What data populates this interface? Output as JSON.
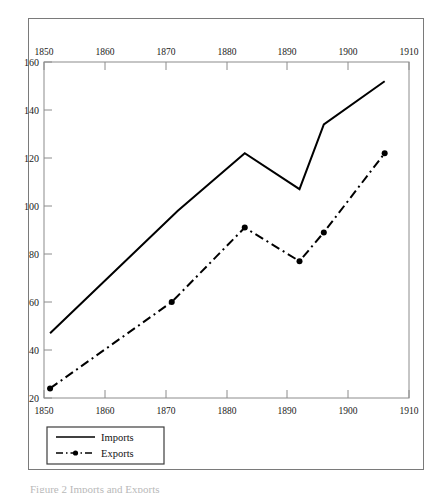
{
  "figure": {
    "caption": "Figure 2 Imports and Exports",
    "background_color": "#ffffff",
    "frame_color": "#7a7a7a",
    "line_color": "#000000"
  },
  "chart_data": {
    "type": "line",
    "title": "",
    "xlabel": "",
    "ylabel": "",
    "xlim": [
      1850,
      1910
    ],
    "ylim": [
      20,
      160
    ],
    "grid": false,
    "legend_position": "bottom-left",
    "x_ticks_top": [
      "1850",
      "1860",
      "1870",
      "1880",
      "1890",
      "1900",
      "1910"
    ],
    "x_ticks_bottom": [
      "1850",
      "1860",
      "1870",
      "1880",
      "1890",
      "1900",
      "1910"
    ],
    "y_ticks": [
      "160",
      "140",
      "120",
      "100",
      "80",
      "60",
      "40",
      "20"
    ],
    "series": [
      {
        "name": "Imports",
        "style": "solid",
        "marker": "none",
        "color": "#000000",
        "x": [
          1851,
          1872,
          1883,
          1892,
          1896,
          1906
        ],
        "values": [
          47,
          98,
          122,
          107,
          134,
          152
        ]
      },
      {
        "name": "Exports",
        "style": "dash-dot",
        "marker": "circle",
        "color": "#000000",
        "x": [
          1851,
          1871,
          1883,
          1892,
          1896,
          1906
        ],
        "values": [
          24,
          60,
          91,
          77,
          89,
          122
        ]
      }
    ]
  },
  "legend": {
    "items": [
      {
        "label": "Imports"
      },
      {
        "label": "Exports"
      }
    ]
  }
}
